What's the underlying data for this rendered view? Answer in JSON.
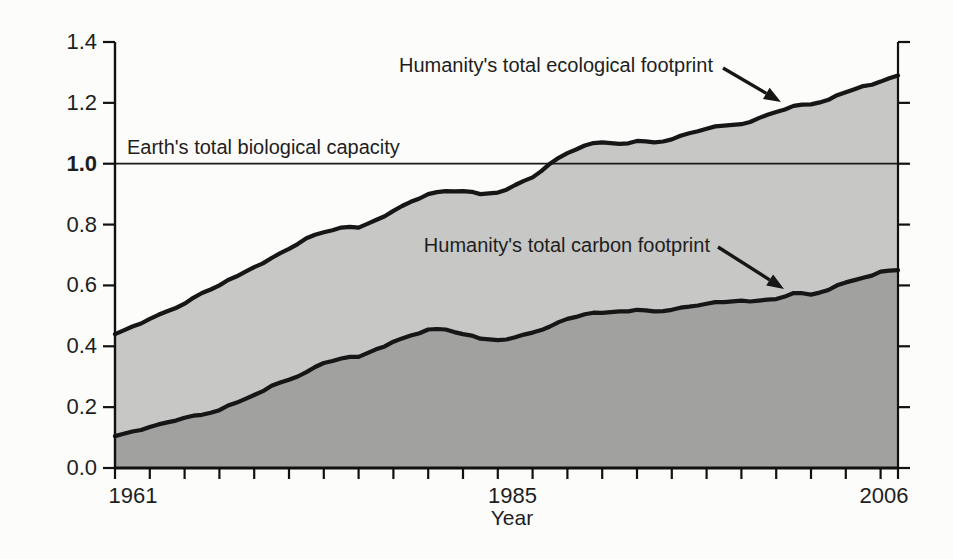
{
  "figure": {
    "background": "#fcfcfa"
  },
  "chart_data": {
    "type": "area",
    "x": [
      1961,
      1962,
      1963,
      1964,
      1965,
      1966,
      1967,
      1968,
      1969,
      1970,
      1971,
      1972,
      1973,
      1974,
      1975,
      1976,
      1977,
      1978,
      1979,
      1980,
      1981,
      1982,
      1983,
      1984,
      1985,
      1986,
      1987,
      1988,
      1989,
      1990,
      1991,
      1992,
      1993,
      1994,
      1995,
      1996,
      1997,
      1998,
      1999,
      2000,
      2001,
      2002,
      2003,
      2004,
      2005,
      2006
    ],
    "series": [
      {
        "name": "Humanity's total ecological footprint",
        "fill": "#c7c7c5",
        "values": [
          0.44,
          0.465,
          0.49,
          0.515,
          0.54,
          0.575,
          0.6,
          0.63,
          0.66,
          0.69,
          0.72,
          0.755,
          0.775,
          0.79,
          0.79,
          0.815,
          0.845,
          0.875,
          0.9,
          0.91,
          0.91,
          0.9,
          0.905,
          0.93,
          0.955,
          1.0,
          1.035,
          1.06,
          1.07,
          1.065,
          1.075,
          1.07,
          1.08,
          1.1,
          1.115,
          1.125,
          1.13,
          1.15,
          1.17,
          1.19,
          1.195,
          1.21,
          1.235,
          1.255,
          1.27,
          1.29
        ]
      },
      {
        "name": "Humanity's total carbon footprint",
        "fill": "#a1a19f",
        "values": [
          0.105,
          0.12,
          0.135,
          0.15,
          0.165,
          0.175,
          0.19,
          0.215,
          0.24,
          0.27,
          0.29,
          0.315,
          0.345,
          0.36,
          0.365,
          0.39,
          0.415,
          0.435,
          0.455,
          0.455,
          0.44,
          0.425,
          0.42,
          0.43,
          0.445,
          0.465,
          0.49,
          0.505,
          0.51,
          0.515,
          0.52,
          0.515,
          0.52,
          0.53,
          0.54,
          0.545,
          0.55,
          0.55,
          0.555,
          0.575,
          0.57,
          0.585,
          0.61,
          0.625,
          0.645,
          0.65
        ]
      }
    ],
    "reference_line": {
      "label": "Earth's total biological capacity",
      "value": 1.0
    },
    "title": "",
    "xlabel": "Year",
    "ylabel": "",
    "xlim": [
      1961,
      2006
    ],
    "ylim": [
      0,
      1.4
    ],
    "x_tick_labels": [
      "1961",
      "1985",
      "2006"
    ],
    "x_minor_tick_step": 2,
    "y_ticks": [
      "0.0",
      "0.2",
      "0.4",
      "0.6",
      "0.8",
      "1.0",
      "1.2",
      "1.4"
    ],
    "y_tick_bold": "1.0",
    "grid": "off",
    "legend": "none (direct labels with arrows)"
  },
  "annotations": {
    "ecological": {
      "text": "Humanity's total ecological footprint"
    },
    "carbon": {
      "text": "Humanity's total carbon footprint"
    },
    "capacity": {
      "text": "Earth's total biological capacity"
    }
  },
  "colors": {
    "curve_stroke": "#161616",
    "axis": "#111111",
    "reference_line": "#1a1a1a",
    "light_fill": "#c7c7c5",
    "dark_fill": "#a1a19f",
    "text": "#1e1e1e"
  }
}
